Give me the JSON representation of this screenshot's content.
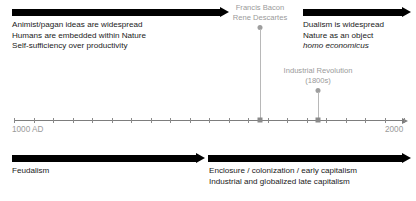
{
  "diagram": {
    "axis": {
      "start_label": "1000 AD",
      "end_label": "2000",
      "start_year": 1000,
      "end_year": 2000,
      "tick_count": 20,
      "tick_interval_years": 50
    },
    "colors": {
      "bar": "#000000",
      "text": "#1a1a1a",
      "muted_text": "#9a9a9a",
      "axis": "#7d7d7d",
      "connector": "#b8b8b8",
      "background": "#ffffff"
    },
    "top_band": {
      "left": {
        "bar_name": "premodern-worldview-bar",
        "lines": [
          "Animist/pagan ideas are widespread",
          "Humans are embedded within Nature",
          "Self-sufficiency over productivity"
        ]
      },
      "right": {
        "bar_name": "modern-worldview-bar",
        "lines": [
          "Dualism is widespread",
          "Nature as an object"
        ],
        "italic_line": "homo economicus"
      }
    },
    "bottom_band": {
      "left": {
        "bar_name": "feudalism-bar",
        "lines": [
          "Feudalism"
        ]
      },
      "right": {
        "bar_name": "capitalism-bar",
        "lines": [
          "Enclosure / colonization / early capitalism",
          "Industrial and globalized late capitalism"
        ]
      }
    },
    "events": [
      {
        "id": "philosophers",
        "lines": [
          "Francis Bacon",
          "Rene Descartes"
        ],
        "year_approx": 1620
      },
      {
        "id": "industrial-revolution",
        "lines": [
          "Industrial Revolution",
          "(1800s)"
        ],
        "year_approx": 1800
      }
    ]
  }
}
